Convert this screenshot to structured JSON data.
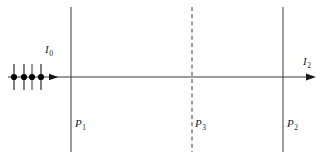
{
  "figure": {
    "background_color": "#ffffff",
    "line_color": "#3a3a3a",
    "marker_color": "#000000",
    "text_color": "#1a1a1a",
    "width": 321,
    "height": 161
  },
  "axis": {
    "name": "beam-axis",
    "y": 77,
    "x_start": 8,
    "x_end": 315,
    "arrowhead_x": 315,
    "direction": "right"
  },
  "beam": {
    "incident_label": "I",
    "incident_subscript": "0",
    "outgoing_label": "I",
    "outgoing_subscript": "2",
    "mid_arrowhead_x": 57,
    "particles": [
      {
        "x": 14,
        "spin": "up"
      },
      {
        "x": 24,
        "spin": "up"
      },
      {
        "x": 32,
        "spin": "up"
      },
      {
        "x": 41,
        "spin": "up"
      }
    ],
    "particle_radius": 3.1,
    "spin_tick_top": 64,
    "spin_tick_bottom": 90
  },
  "planes": [
    {
      "id": "P1",
      "label": "P",
      "subscript": "1",
      "x": 71,
      "y_top": 7,
      "y_bottom": 152,
      "style": "solid"
    },
    {
      "id": "P3",
      "label": "P",
      "subscript": "3",
      "x": 192,
      "y_top": 7,
      "y_bottom": 152,
      "style": "dashed"
    },
    {
      "id": "P2",
      "label": "P",
      "subscript": "2",
      "x": 283,
      "y_top": 7,
      "y_bottom": 152,
      "style": "solid"
    }
  ]
}
